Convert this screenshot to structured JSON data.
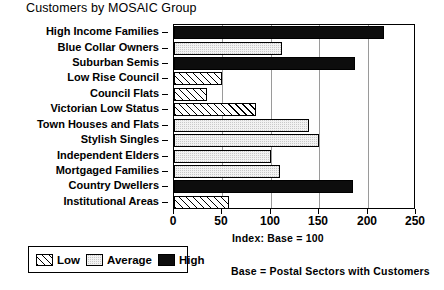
{
  "chart_data": {
    "type": "bar",
    "title": "Customers by MOSAIC Group",
    "orientation": "horizontal",
    "xlabel": "Index: Base = 100",
    "ylabel": "",
    "xlim": [
      0,
      250
    ],
    "xticks": [
      0,
      50,
      100,
      150,
      200,
      250
    ],
    "xticklabels": [
      "0",
      "50",
      "100",
      "150",
      "200",
      "250"
    ],
    "grid": true,
    "grid_axis": "x",
    "legend_position": "bottom-left",
    "categories": [
      "High Income Families",
      "Blue Collar Owners",
      "Suburban Semis",
      "Low Rise Council",
      "Council Flats",
      "Victorian Low Status",
      "Town Houses and Flats",
      "Stylish Singles",
      "Independent Elders",
      "Mortgaged Families",
      "Country Dwellers",
      "Institutional Areas"
    ],
    "values": [
      217,
      112,
      187,
      50,
      34,
      85,
      139,
      150,
      100,
      110,
      185,
      57
    ],
    "bar_classes": [
      "high",
      "average",
      "high",
      "low",
      "low",
      "low",
      "average",
      "average",
      "average",
      "average",
      "high",
      "low"
    ],
    "annotations": [
      "Index: Base = 100",
      "Base = Postal Sectors with Customers"
    ],
    "footnote": "Base = Postal Sectors with Customers"
  },
  "legend": {
    "items": [
      {
        "label": "Low",
        "key": "low",
        "fill": "hatched-diagonal"
      },
      {
        "label": "Average",
        "key": "average",
        "fill": "checkered-grey"
      },
      {
        "label": "High",
        "key": "high",
        "fill": "solid-black"
      }
    ]
  },
  "colors": {
    "high": "#0d0d0d",
    "average": "#c9c9c9",
    "low": "#ffffff",
    "axis": "#000000",
    "grid": "#9a9a9a",
    "background": "#ffffff"
  }
}
